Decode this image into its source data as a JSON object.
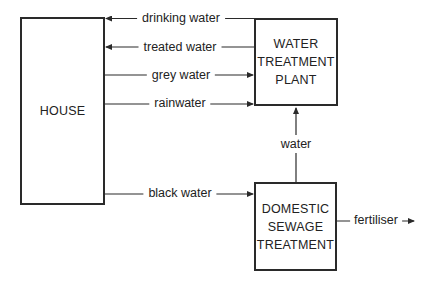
{
  "diagram": {
    "nodes": {
      "house": {
        "label_lines": [
          "HOUSE"
        ]
      },
      "water_treatment_plant": {
        "label_lines": [
          "WATER",
          "TREATMENT",
          "PLANT"
        ]
      },
      "domestic_sewage_treatment": {
        "label_lines": [
          "DOMESTIC",
          "SEWAGE",
          "TREATMENT"
        ]
      }
    },
    "flows": [
      {
        "id": "drinking_water",
        "label": "drinking water",
        "from": "water_treatment_plant",
        "to": "house"
      },
      {
        "id": "treated_water",
        "label": "treated water",
        "from": "water_treatment_plant",
        "to": "house"
      },
      {
        "id": "grey_water",
        "label": "grey water",
        "from": "house",
        "to": "water_treatment_plant"
      },
      {
        "id": "rainwater",
        "label": "rainwater",
        "from": "house",
        "to": "water_treatment_plant"
      },
      {
        "id": "black_water",
        "label": "black water",
        "from": "house",
        "to": "domestic_sewage_treatment"
      },
      {
        "id": "water",
        "label": "water",
        "from": "domestic_sewage_treatment",
        "to": "water_treatment_plant"
      },
      {
        "id": "fertiliser",
        "label": "fertiliser",
        "from": "domestic_sewage_treatment",
        "to": "output"
      }
    ],
    "line_color": "#2a2a2a"
  }
}
